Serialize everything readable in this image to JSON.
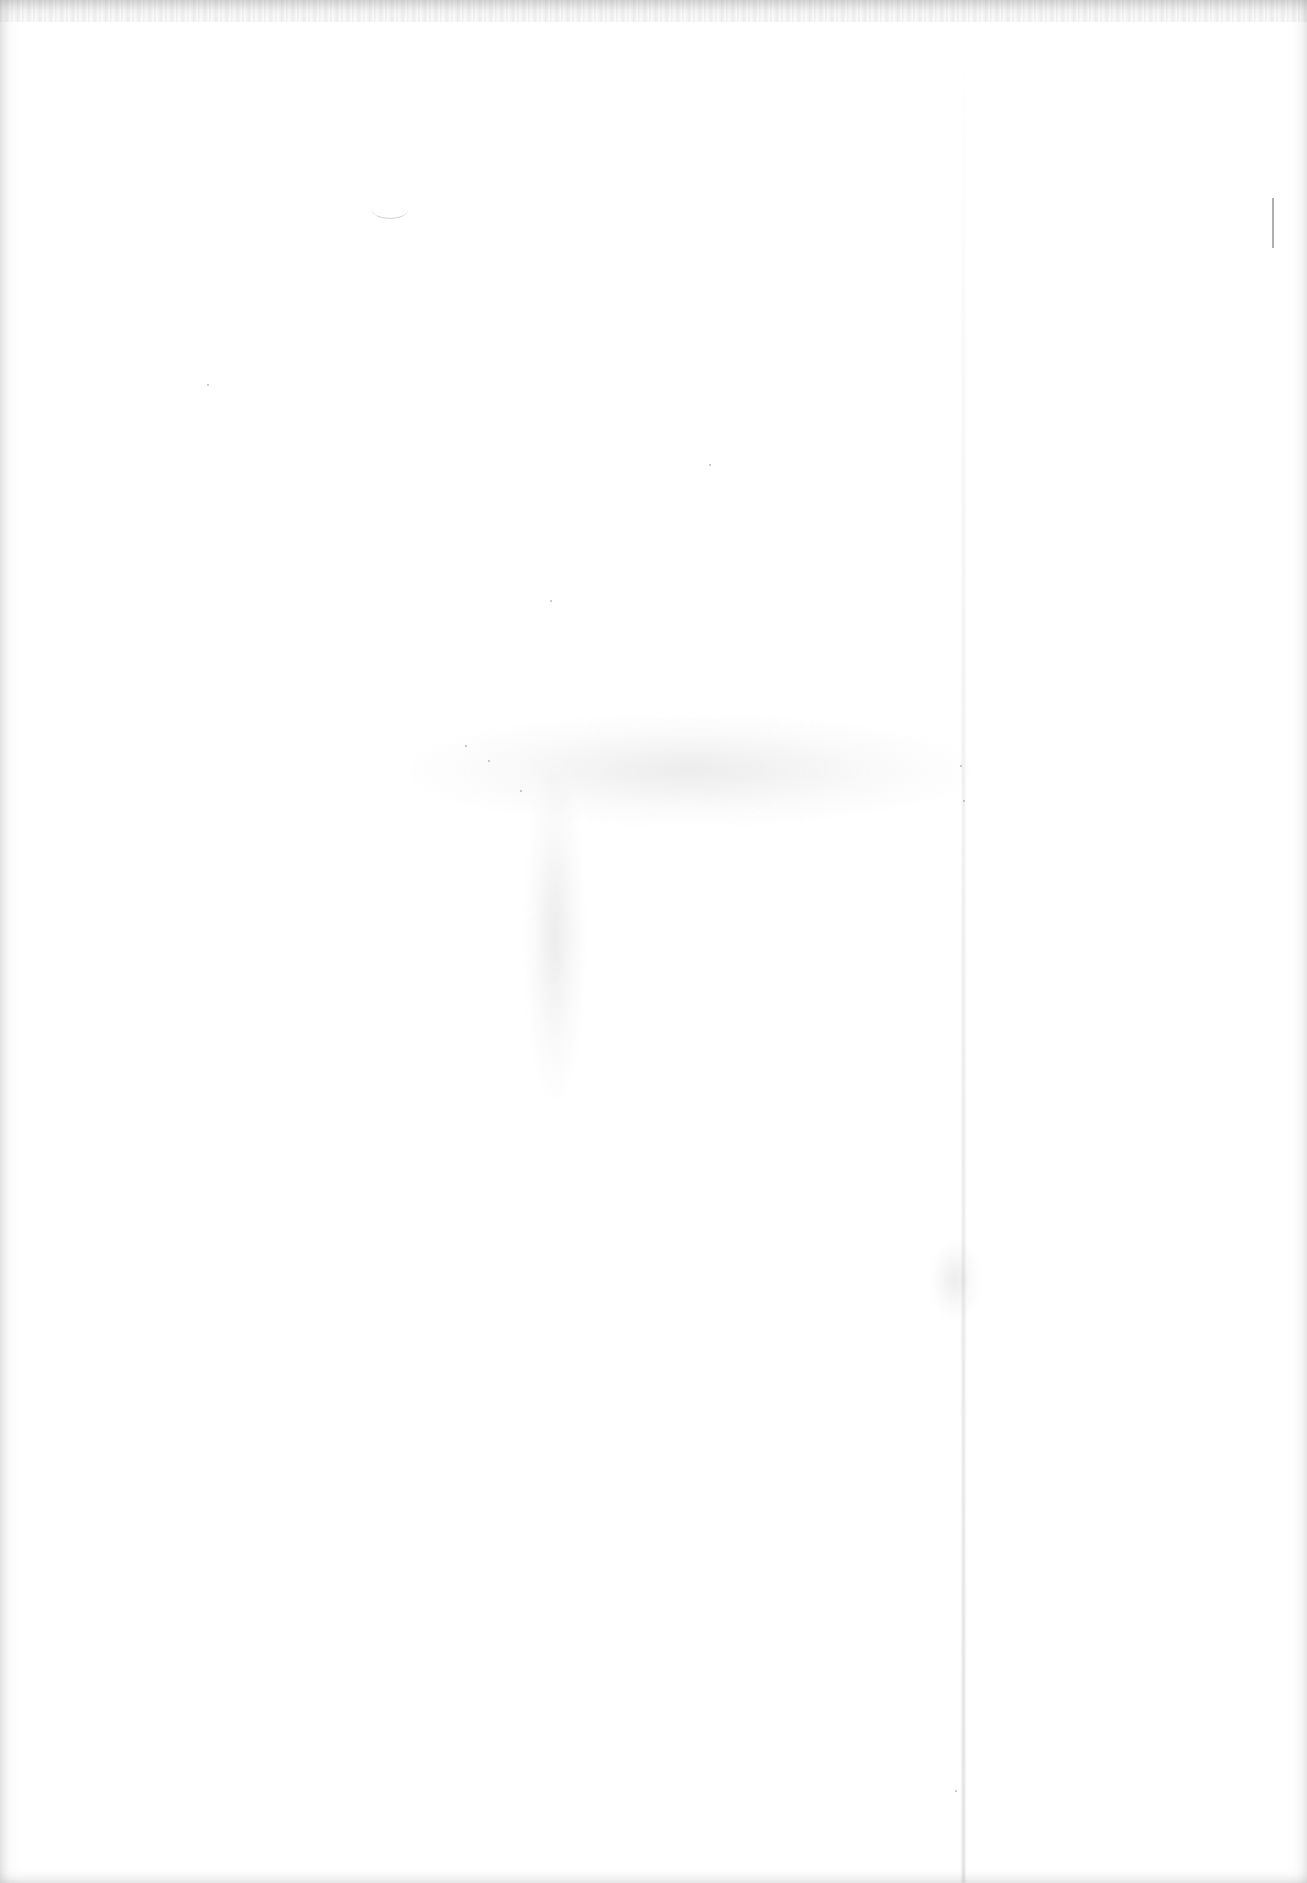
{
  "document": {
    "type": "scanned-page",
    "content": "",
    "is_blank": true,
    "marks": [
      {
        "kind": "vertical-tick",
        "position": "right-margin"
      }
    ]
  },
  "colors": {
    "paper": "#ffffff",
    "edge_shadow": "#a0a0a0",
    "tick_mark": "#9a9a9a"
  }
}
